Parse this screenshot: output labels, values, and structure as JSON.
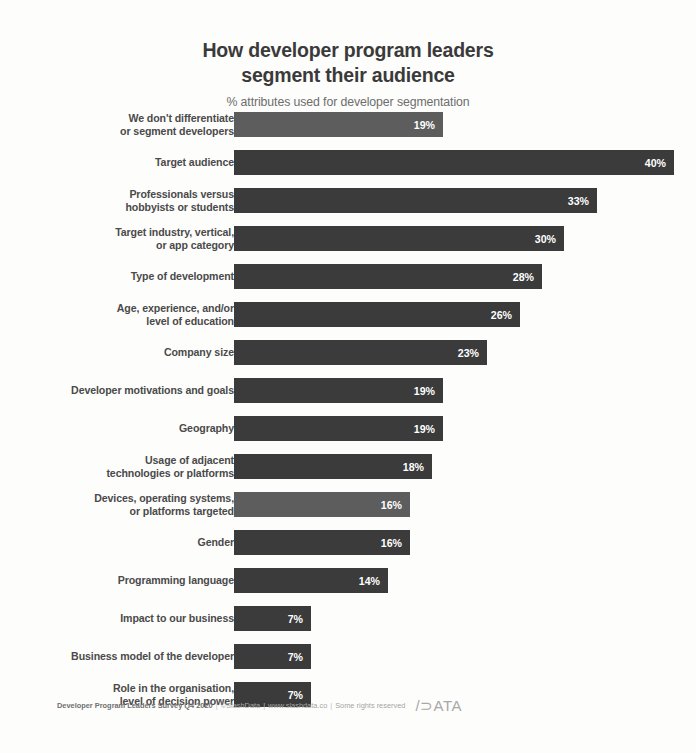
{
  "chart_data": {
    "type": "bar",
    "orientation": "horizontal",
    "title": "How developer program leaders segment their audience",
    "title_line1": "How developer program leaders",
    "title_line2": "segment their audience",
    "subtitle": "% attributes used for developer segmentation",
    "xlabel": "",
    "ylabel": "",
    "xlim": [
      0,
      40
    ],
    "grid": false,
    "legend": null,
    "value_suffix": "%",
    "categories": [
      "We don't differentiate or segment developers",
      "Target audience",
      "Professionals versus hobbyists or students",
      "Target industry, vertical, or app category",
      "Type of development",
      "Age, experience, and/or level of education",
      "Company size",
      "Developer motivations and goals",
      "Geography",
      "Usage of adjacent technologies or platforms",
      "Devices, operating systems, or platforms targeted",
      "Gender",
      "Programming language",
      "Impact to our business",
      "Business model of the developer",
      "Role in the organisation, level of decision power"
    ],
    "values": [
      19,
      40,
      33,
      30,
      28,
      26,
      23,
      19,
      19,
      18,
      16,
      16,
      14,
      7,
      7,
      7
    ],
    "bars": [
      {
        "label_line1": "We don't differentiate",
        "label_line2": "or segment developers",
        "value": 19,
        "value_label": "19%",
        "highlight": true
      },
      {
        "label_line1": "Target audience",
        "label_line2": "",
        "value": 40,
        "value_label": "40%",
        "highlight": false
      },
      {
        "label_line1": "Professionals versus",
        "label_line2": "hobbyists or students",
        "value": 33,
        "value_label": "33%",
        "highlight": false
      },
      {
        "label_line1": "Target industry, vertical,",
        "label_line2": "or app category",
        "value": 30,
        "value_label": "30%",
        "highlight": false
      },
      {
        "label_line1": "Type of development",
        "label_line2": "",
        "value": 28,
        "value_label": "28%",
        "highlight": false
      },
      {
        "label_line1": "Age, experience, and/or",
        "label_line2": "level of education",
        "value": 26,
        "value_label": "26%",
        "highlight": false
      },
      {
        "label_line1": "Company size",
        "label_line2": "",
        "value": 23,
        "value_label": "23%",
        "highlight": false
      },
      {
        "label_line1": "Developer motivations and goals",
        "label_line2": "",
        "value": 19,
        "value_label": "19%",
        "highlight": false
      },
      {
        "label_line1": "Geography",
        "label_line2": "",
        "value": 19,
        "value_label": "19%",
        "highlight": false
      },
      {
        "label_line1": "Usage of adjacent",
        "label_line2": "technologies or platforms",
        "value": 18,
        "value_label": "18%",
        "highlight": false
      },
      {
        "label_line1": "Devices, operating systems,",
        "label_line2": "or platforms targeted",
        "value": 16,
        "value_label": "16%",
        "highlight": true
      },
      {
        "label_line1": "Gender",
        "label_line2": "",
        "value": 16,
        "value_label": "16%",
        "highlight": false
      },
      {
        "label_line1": "Programming language",
        "label_line2": "",
        "value": 14,
        "value_label": "14%",
        "highlight": false
      },
      {
        "label_line1": "Impact to our business",
        "label_line2": "",
        "value": 7,
        "value_label": "7%",
        "highlight": false
      },
      {
        "label_line1": "Business model of the developer",
        "label_line2": "",
        "value": 7,
        "value_label": "7%",
        "highlight": false
      },
      {
        "label_line1": "Role in the organisation,",
        "label_line2": "level of decision power",
        "value": 7,
        "value_label": "7%",
        "highlight": false
      }
    ],
    "colors": {
      "bar_default": "#3b3b3b",
      "bar_highlight": "#5d5d5d",
      "value_text": "#ffffff",
      "label_text": "#4a4a4a",
      "title_text": "#3a3a3a",
      "subtitle_text": "#6d6d6d",
      "background": "#fdfdfc"
    }
  },
  "footer": {
    "source": "Developer Program Leaders Survey Q4 2020",
    "sep1": "|",
    "copyright": "©SlashData",
    "sep2": "|",
    "website": "www.slashdata.co",
    "sep3": "|",
    "rights": "Some rights reserved",
    "logo": "/⊃ATA"
  }
}
